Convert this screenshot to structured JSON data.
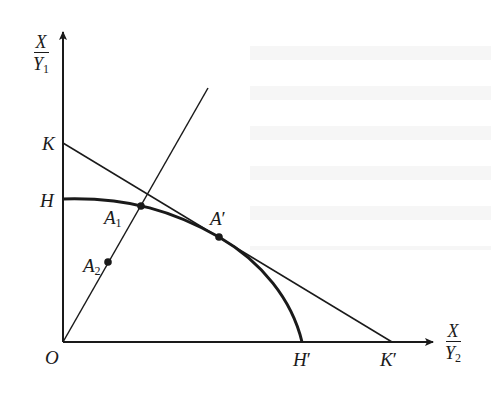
{
  "diagram": {
    "type": "production-possibility-frontier",
    "axes": {
      "y": {
        "numerator": "X",
        "denominator": "Y",
        "denominator_sub": "1"
      },
      "x": {
        "numerator": "X",
        "denominator": "Y",
        "denominator_sub": "2"
      }
    },
    "points": {
      "origin": {
        "label": "O"
      },
      "K": {
        "label": "K"
      },
      "H": {
        "label": "H"
      },
      "H_prime": {
        "label": "H",
        "prime": "′"
      },
      "K_prime": {
        "label": "K",
        "prime": "′"
      },
      "A1": {
        "label": "A",
        "sub": "1"
      },
      "A2": {
        "label": "A",
        "sub": "2"
      },
      "A_prime": {
        "label": "A",
        "prime": "′"
      }
    },
    "elements": [
      "y-axis with arrow",
      "x-axis with arrow",
      "concave curve H to H′ (production frontier)",
      "straight line K to K′ tangent at A′",
      "ray from O through A2 and A1"
    ],
    "colors": {
      "ink": "#1a1a1a",
      "background": "#ffffff"
    }
  }
}
